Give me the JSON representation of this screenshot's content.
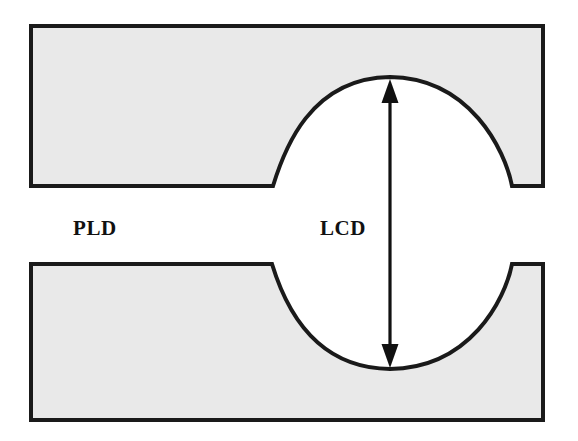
{
  "figure": {
    "type": "technical-cross-section-diagram",
    "background_color": "#ffffff",
    "block_fill_color": "#e9e9e9",
    "outline_color": "#1a1a1a",
    "arrow_color": "#111111"
  },
  "labels": {
    "pld": "PLD",
    "lcd": "LCD"
  },
  "geometry": {
    "upper_block": {
      "left": 31,
      "top": 26,
      "right": 543,
      "bottom": 186,
      "notch_start_x": 273,
      "notch_end_x": 512,
      "notch_apex_x": 390,
      "notch_apex_y": 77
    },
    "lower_block": {
      "left": 31,
      "top": 264,
      "right": 543,
      "bottom": 420,
      "notch_start_x": 272,
      "notch_end_x": 512,
      "notch_trough_x": 390,
      "notch_trough_y": 369
    },
    "dimension_arrow": {
      "x": 390,
      "top_tip_y": 79,
      "bottom_tip_y": 368,
      "head_width": 17,
      "head_height": 23,
      "double_headed": true
    }
  },
  "annotations": [
    {
      "name": "pld",
      "text": "PLD",
      "meaning": "parallel land distance, labels the flat gap region at left between the two blocks"
    },
    {
      "name": "lcd",
      "text": "LCD",
      "meaning": "local constriction distance, measured by the vertical double-headed arrow across the curved notch opening"
    }
  ]
}
